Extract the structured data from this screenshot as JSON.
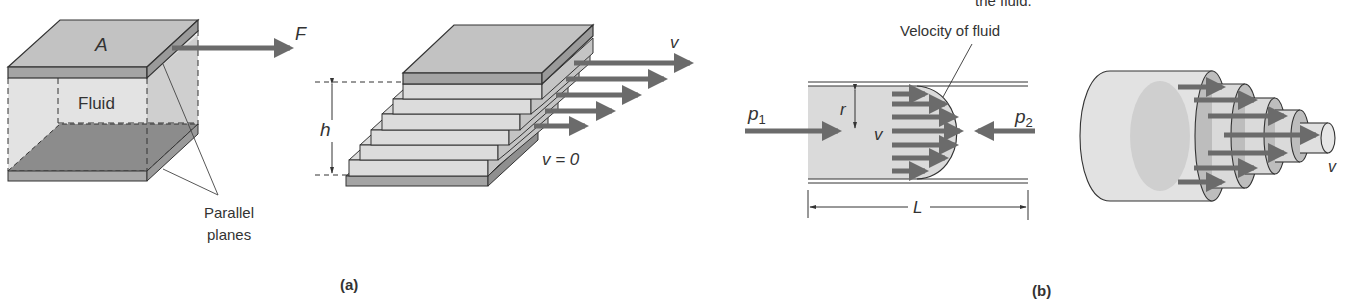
{
  "figure": {
    "top_cutoff_text": "the fluid.",
    "panel_a": {
      "caption": "(a)",
      "area_label": "A",
      "force_label": "F",
      "fluid_label": "Fluid",
      "planes_label_line1": "Parallel",
      "planes_label_line2": "planes",
      "height_label": "h",
      "top_velocity_label": "v",
      "bottom_velocity_label": "v = 0"
    },
    "panel_b": {
      "caption": "(b)",
      "profile_label": "Velocity of fluid",
      "pressure_in_label": "p",
      "pressure_in_sub": "1",
      "pressure_out_label": "p",
      "pressure_out_sub": "2",
      "radius_label": "r",
      "velocity_label": "v",
      "length_label": "L",
      "cylinder_velocity_label": "v"
    }
  },
  "colors": {
    "arrow": "#6b6b6b",
    "plate_top": "#bdbdbd",
    "plate_band": "#9a9a9a",
    "fluid": "#dcdcdc",
    "bottom_plate": "#8a8a8a",
    "outline": "#333333"
  }
}
